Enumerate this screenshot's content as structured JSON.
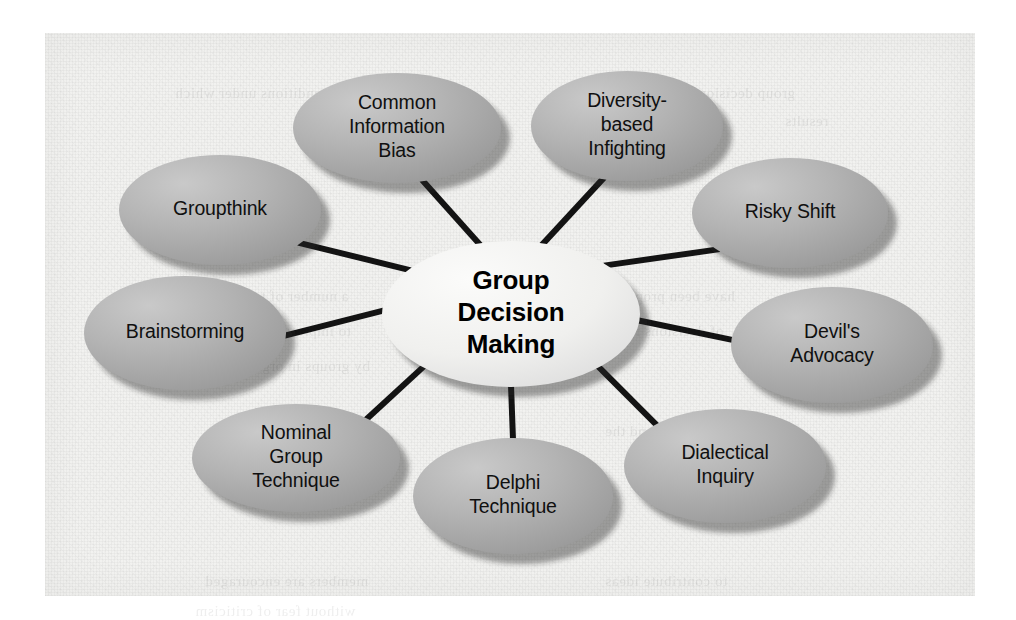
{
  "figure": {
    "type": "hub-and-spoke-diagram",
    "center": {
      "id": "group-decision-making",
      "lines": [
        "Group",
        "Decision",
        "Making"
      ],
      "text": "Group Decision Making",
      "fill": "#f0f0ee",
      "cx": 511,
      "cy": 314,
      "rx": 129,
      "ry": 73
    },
    "node_fill_light": "#c3c3c3",
    "node_fill_dark": "#9d9d9d",
    "connector_color": "#131313",
    "label_color": "#101010",
    "plate_color": "#f2f2f0",
    "nodes": [
      {
        "id": "common-information-bias",
        "lines": [
          "Common",
          "Information",
          "Bias"
        ],
        "text": "Common Information Bias",
        "cx": 397,
        "cy": 128,
        "rx": 104,
        "ry": 55,
        "angle": 256
      },
      {
        "id": "diversity-based-infighting",
        "lines": [
          "Diversity-",
          "based",
          "Infighting"
        ],
        "text": "Diversity-based Infighting",
        "cx": 627,
        "cy": 126,
        "rx": 96,
        "ry": 55,
        "angle": 284
      },
      {
        "id": "risky-shift",
        "lines": [
          "Risky Shift"
        ],
        "text": "Risky Shift",
        "cx": 790,
        "cy": 213,
        "rx": 98,
        "ry": 55,
        "angle": 317
      },
      {
        "id": "devils-advocacy",
        "lines": [
          "Devil's",
          "Advocacy"
        ],
        "text": "Devil's Advocacy",
        "cx": 832,
        "cy": 345,
        "rx": 101,
        "ry": 58,
        "angle": 5
      },
      {
        "id": "dialectical-inquiry",
        "lines": [
          "Dialectical",
          "Inquiry"
        ],
        "text": "Dialectical Inquiry",
        "cx": 725,
        "cy": 466,
        "rx": 101,
        "ry": 57,
        "angle": 47
      },
      {
        "id": "delphi-technique",
        "lines": [
          "Delphi",
          "Technique"
        ],
        "text": "Delphi Technique",
        "cx": 513,
        "cy": 496,
        "rx": 100,
        "ry": 58,
        "angle": 90
      },
      {
        "id": "nominal-group-technique",
        "lines": [
          "Nominal",
          "Group",
          "Technique"
        ],
        "text": "Nominal Group Technique",
        "cx": 296,
        "cy": 458,
        "rx": 104,
        "ry": 54,
        "angle": 133
      },
      {
        "id": "brainstorming",
        "lines": [
          "Brainstorming"
        ],
        "text": "Brainstorming",
        "cx": 185,
        "cy": 333,
        "rx": 101,
        "ry": 57,
        "angle": 183
      },
      {
        "id": "groupthink",
        "lines": [
          "Groupthink"
        ],
        "text": "Groupthink",
        "cx": 220,
        "cy": 210,
        "rx": 101,
        "ry": 55,
        "angle": 218
      }
    ],
    "bleed_text": [
      {
        "x": 130,
        "y": 52,
        "text": "the conditions under which"
      },
      {
        "x": 600,
        "y": 52,
        "text": "group decision making"
      },
      {
        "x": 740,
        "y": 80,
        "text": "results"
      },
      {
        "x": 150,
        "y": 255,
        "text": "a number of techniques"
      },
      {
        "x": 560,
        "y": 255,
        "text": "have been proposed"
      },
      {
        "x": 160,
        "y": 290,
        "text": "to improve the quality"
      },
      {
        "x": 560,
        "y": 290,
        "text": "of decisions made"
      },
      {
        "x": 150,
        "y": 325,
        "text": "by groups in organizations"
      },
      {
        "x": 160,
        "y": 390,
        "text": "these processes include"
      },
      {
        "x": 560,
        "y": 390,
        "text": "brainstorming and the"
      },
      {
        "x": 150,
        "y": 425,
        "text": "nominal group technique"
      },
      {
        "x": 160,
        "y": 540,
        "text": "members are encouraged"
      },
      {
        "x": 560,
        "y": 540,
        "text": "to contribute ideas"
      },
      {
        "x": 150,
        "y": 570,
        "text": "without fear of criticism"
      }
    ]
  }
}
